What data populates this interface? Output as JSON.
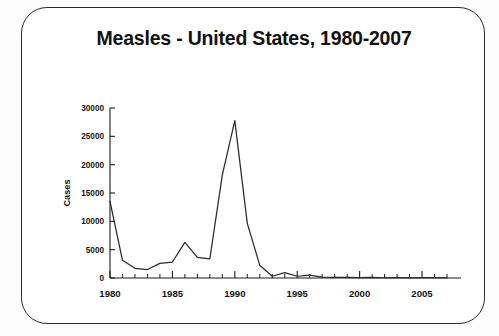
{
  "card": {
    "title": "Measles - United States, 1980-2007"
  },
  "chart_data": {
    "type": "line",
    "title": "Measles - United States, 1980-2007",
    "xlabel": "",
    "ylabel": "Cases",
    "x": [
      1980,
      1981,
      1982,
      1983,
      1984,
      1985,
      1986,
      1987,
      1988,
      1989,
      1990,
      1991,
      1992,
      1993,
      1994,
      1995,
      1996,
      1997,
      1998,
      1999,
      2000,
      2001,
      2002,
      2003,
      2004,
      2005,
      2006,
      2007
    ],
    "values": [
      13506,
      3124,
      1714,
      1497,
      2587,
      2822,
      6282,
      3655,
      3396,
      18193,
      27786,
      9643,
      2237,
      312,
      963,
      309,
      508,
      138,
      100,
      100,
      86,
      116,
      44,
      56,
      37,
      66,
      55,
      43
    ],
    "series": [
      {
        "name": "Cases",
        "values": [
          13506,
          3124,
          1714,
          1497,
          2587,
          2822,
          6282,
          3655,
          3396,
          18193,
          27786,
          9643,
          2237,
          312,
          963,
          309,
          508,
          138,
          100,
          100,
          86,
          116,
          44,
          56,
          37,
          66,
          55,
          43
        ]
      }
    ],
    "xlim": [
      1980,
      2007
    ],
    "ylim": [
      0,
      30000
    ],
    "ytick_labels": [
      "30000",
      "25000",
      "20000",
      "15000",
      "10000",
      "5000",
      "0"
    ],
    "ytick_values": [
      30000,
      25000,
      20000,
      15000,
      10000,
      5000,
      0
    ],
    "xtick_labels": [
      "1980",
      "1985",
      "1990",
      "1995",
      "2000",
      "2005"
    ],
    "xtick_values": [
      1980,
      1985,
      1990,
      1995,
      2000,
      2005
    ],
    "minor_xticks_every": 1,
    "grid": false,
    "legend": false,
    "line_color": "#2a2a2a",
    "axis_color": "#1c1c1c",
    "background": "#ffffff"
  }
}
